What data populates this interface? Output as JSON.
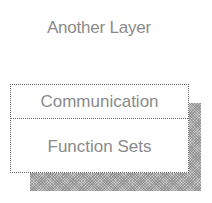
{
  "diagram": {
    "title": "Another Layer",
    "box": {
      "top_label": "Communication",
      "bottom_label": "Function Sets"
    },
    "colors": {
      "text": "#8a8a8a",
      "border": "#666666",
      "shadow": "#c8c8c8"
    }
  }
}
